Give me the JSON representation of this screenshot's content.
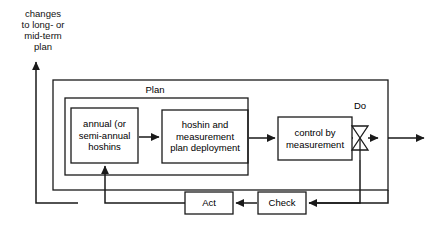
{
  "diagram": {
    "title_annotation": "changes\nto long- or\nmid-term\nplan",
    "outer_label": "Plan",
    "do_label": "Do",
    "boxes": {
      "annual": "annual  (or\nsemi-annual\nhoshins",
      "deployment": "hoshin and\nmeasurement\nplan deployment",
      "control": "control by\nmeasurement",
      "act": "Act",
      "check": "Check"
    },
    "icons": {
      "valve": "valve-bowtie-icon"
    },
    "colors": {
      "stroke": "#1a1a1a",
      "background": "#ffffff",
      "text": "#111111"
    }
  }
}
